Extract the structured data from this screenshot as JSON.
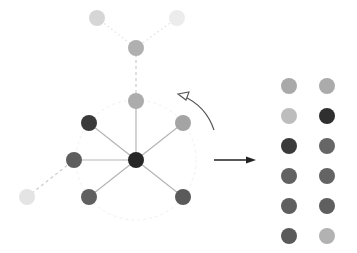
{
  "diagram": {
    "title": "",
    "colors": {
      "darkest": "#2b2b2b",
      "dark": "#5c5c5c",
      "mid": "#a6a6a6",
      "light": "#c4c4c4",
      "faint": "#e2e2e2",
      "edge": "#b5b5b5",
      "edge_dashed": "#cccccc",
      "arrow": "#222222"
    },
    "graph": {
      "nodes": [
        {
          "id": "top-left",
          "x": 97,
          "y": 18,
          "color": "#d6d6d6"
        },
        {
          "id": "top-right",
          "x": 177,
          "y": 18,
          "color": "#ececec"
        },
        {
          "id": "upper-mid",
          "x": 136,
          "y": 48,
          "color": "#b0b0b0"
        },
        {
          "id": "hub-neighbor-top",
          "x": 136,
          "y": 101,
          "color": "#acacac"
        },
        {
          "id": "upper-left",
          "x": 89,
          "y": 123,
          "color": "#3a3a3a"
        },
        {
          "id": "upper-right",
          "x": 183,
          "y": 123,
          "color": "#a4a4a4"
        },
        {
          "id": "left",
          "x": 74,
          "y": 160,
          "color": "#5e5e5e"
        },
        {
          "id": "center",
          "x": 136,
          "y": 160,
          "color": "#262626"
        },
        {
          "id": "lower-left",
          "x": 89,
          "y": 197,
          "color": "#606060"
        },
        {
          "id": "lower-right",
          "x": 183,
          "y": 197,
          "color": "#5a5a5a"
        },
        {
          "id": "far-left",
          "x": 27,
          "y": 197,
          "color": "#e4e4e4"
        }
      ],
      "edges": [
        {
          "from": "top-left",
          "to": "upper-mid",
          "style": "dotted"
        },
        {
          "from": "top-right",
          "to": "upper-mid",
          "style": "dotted"
        },
        {
          "from": "upper-mid",
          "to": "hub-neighbor-top",
          "style": "dashed"
        },
        {
          "from": "hub-neighbor-top",
          "to": "center",
          "style": "solid"
        },
        {
          "from": "upper-left",
          "to": "center",
          "style": "solid"
        },
        {
          "from": "upper-right",
          "to": "center",
          "style": "solid"
        },
        {
          "from": "left",
          "to": "center",
          "style": "solid"
        },
        {
          "from": "lower-left",
          "to": "center",
          "style": "solid"
        },
        {
          "from": "lower-right",
          "to": "center",
          "style": "solid"
        },
        {
          "from": "far-left",
          "to": "left",
          "style": "dashed"
        }
      ],
      "neighborhood_circle": {
        "cx": 136,
        "cy": 160,
        "r": 60
      }
    },
    "rotation_arrow": {
      "direction": "counter-clockwise"
    },
    "transform_arrow": {
      "x1": 214,
      "y1": 160,
      "x2": 256,
      "y2": 160
    },
    "output_grid": {
      "columns_x": [
        289,
        327
      ],
      "rows_y": [
        86,
        116,
        146,
        176,
        206,
        236
      ],
      "cells": [
        [
          "#a9a9a9",
          "#ababab"
        ],
        [
          "#bdbdbd",
          "#2f2f2f"
        ],
        [
          "#3a3a3a",
          "#666666"
        ],
        [
          "#626262",
          "#646464"
        ],
        [
          "#5f5f5f",
          "#5f5f5f"
        ],
        [
          "#5a5a5a",
          "#b2b2b2"
        ]
      ]
    }
  }
}
